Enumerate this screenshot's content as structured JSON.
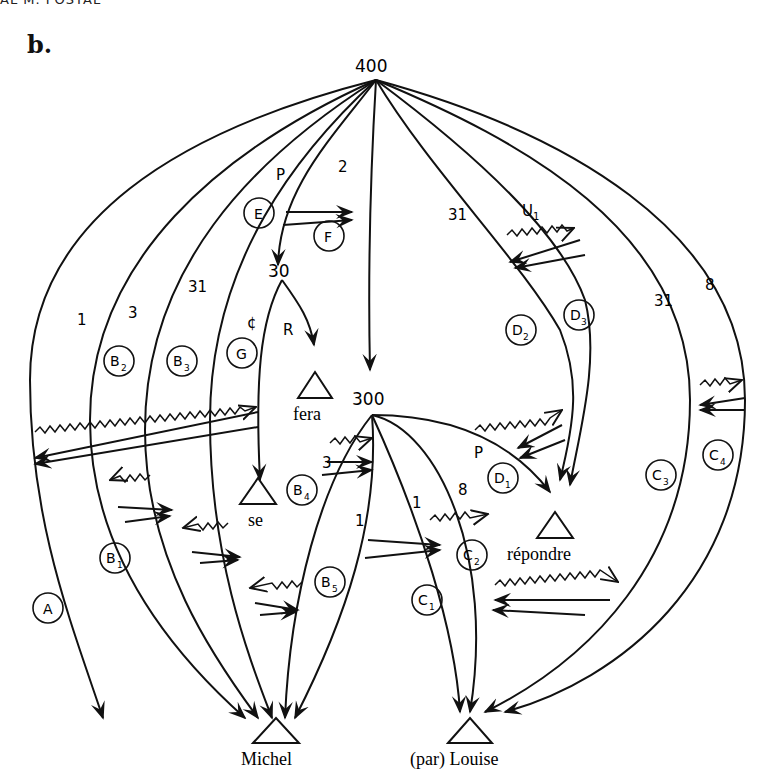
{
  "header": {
    "running_head": "AL M. POSTAL"
  },
  "panel_label": "b.",
  "nodes": {
    "n400": "400",
    "n30": "30",
    "n300": "300"
  },
  "terminals": {
    "fera": "fera",
    "se": "se",
    "repondre": "répondre",
    "michel": "Michel",
    "louise": "(par) Louise"
  },
  "arc_labels": {
    "p_top": "P",
    "two": "2",
    "one_left": "1",
    "three_left": "3",
    "thirtyone_left": "31",
    "null": "¢",
    "r": "R",
    "thirtyone_mid": "31",
    "u1": "U",
    "u1_sub": "1",
    "thirtyone_right": "31",
    "eight_right": "8",
    "three_b4": "3",
    "one_b4": "1",
    "one_c": "1",
    "eight_c": "8",
    "p_d1": "P"
  },
  "circled": {
    "A": {
      "main": "A",
      "sub": ""
    },
    "B1": {
      "main": "B",
      "sub": "1"
    },
    "B2": {
      "main": "B",
      "sub": "2"
    },
    "B3": {
      "main": "B",
      "sub": "3"
    },
    "B4": {
      "main": "B",
      "sub": "4"
    },
    "B5": {
      "main": "B",
      "sub": "5"
    },
    "C1": {
      "main": "C",
      "sub": "1"
    },
    "C2": {
      "main": "C",
      "sub": "2"
    },
    "C3": {
      "main": "C",
      "sub": "3"
    },
    "C4": {
      "main": "C",
      "sub": "4"
    },
    "D1": {
      "main": "D",
      "sub": "1"
    },
    "D2": {
      "main": "D",
      "sub": "2"
    },
    "D3": {
      "main": "D",
      "sub": "3"
    },
    "E": {
      "main": "E",
      "sub": ""
    },
    "F": {
      "main": "F",
      "sub": ""
    },
    "G": {
      "main": "G",
      "sub": ""
    }
  }
}
